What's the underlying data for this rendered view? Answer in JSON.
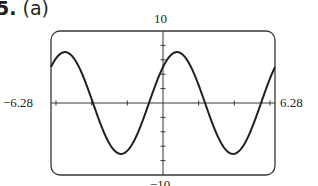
{
  "problem": {
    "number": "5.",
    "part": "(a)"
  },
  "chart_data": {
    "type": "line",
    "title": "",
    "xlabel": "",
    "ylabel": "",
    "xlim": [
      -6.28,
      6.28
    ],
    "ylim": [
      -10,
      10
    ],
    "x_tick_labels": {
      "min": "−6.28",
      "max": "6.28"
    },
    "y_tick_labels": {
      "min": "−10",
      "max": "10"
    },
    "x_tick_step": 2,
    "y_tick_step": 2,
    "grid": false,
    "legend": null,
    "series": [
      {
        "name": "y = 5 sin x + 5 cos x",
        "amplitude": 7.07,
        "phase_shift": 0.785,
        "period": 6.28,
        "x": [
          -6.28,
          -5.5,
          -3.93,
          -2.36,
          -0.79,
          0.79,
          2.36,
          3.93,
          5.5,
          6.28
        ],
        "y": [
          5.0,
          7.07,
          0,
          -7.07,
          0,
          7.07,
          0,
          -7.07,
          0,
          5.0
        ]
      }
    ],
    "line_color": "#231f20"
  }
}
